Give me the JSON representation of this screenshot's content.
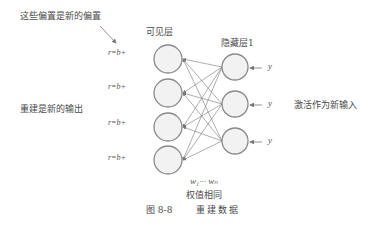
{
  "annotations": {
    "bias_note": "这些偏置是新的偏置",
    "reconstruction_note": "重建是新的输出",
    "activation_note": "激活作为新输入",
    "shared_weights_label": "权值相同",
    "weights_math": "w₁··· wₙ"
  },
  "layers": {
    "visible": {
      "label": "可见层",
      "nodes": 4,
      "bias_labels": [
        "r=b+",
        "r=b+",
        "r=b+",
        "r=b+"
      ]
    },
    "hidden": {
      "label": "隐藏层1",
      "nodes": 3,
      "input_labels": [
        "y",
        "y",
        "y"
      ]
    }
  },
  "caption": {
    "figure_number": "图 8-8",
    "title": "重建数据"
  },
  "colors": {
    "node_stroke": "#8a8a8a",
    "node_fill": "#f2f2f2",
    "edge": "#777777",
    "text": "#4a4a4a"
  }
}
